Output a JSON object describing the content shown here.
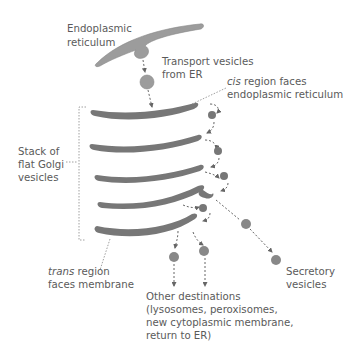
{
  "diagram": {
    "colors": {
      "er_fill": "#9c9c9c",
      "golgi_fill": "#777777",
      "vesicle_fill": "#8a8a8a",
      "text": "#5a5a5a",
      "arrow": "#666666"
    },
    "labels": {
      "er_line1": "Endoplasmic",
      "er_line2": "reticulum",
      "transport_line1": "Transport vesicles",
      "transport_line2": "from ER",
      "cis_italic": "cis",
      "cis_rest": " region faces",
      "cis_line2": "endoplasmic reticulum",
      "stack_line1": "Stack of",
      "stack_line2": "flat Golgi",
      "stack_line3": "vesicles",
      "trans_italic": "trans",
      "trans_rest": " region",
      "trans_line2": "faces membrane",
      "other_line1": "Other destinations",
      "other_line2": "(lysosomes, peroxisomes,",
      "other_line3": "new cytoplasmic membrane,",
      "other_line4": "return to ER)",
      "secretory_line1": "Secretory",
      "secretory_line2": "vesicles"
    }
  }
}
